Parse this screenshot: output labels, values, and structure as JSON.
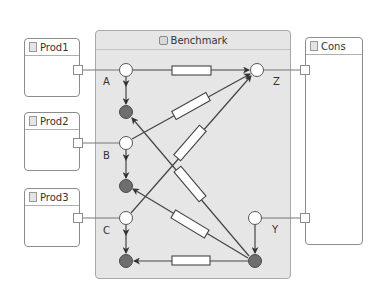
{
  "container": {
    "title": "Benchmark",
    "icon": "benchmark-icon"
  },
  "components": [
    {
      "id": "prod1",
      "title": "Prod1",
      "icon": "document-icon"
    },
    {
      "id": "prod2",
      "title": "Prod2",
      "icon": "document-icon"
    },
    {
      "id": "prod3",
      "title": "Prod3",
      "icon": "document-icon"
    },
    {
      "id": "cons",
      "title": "Cons",
      "icon": "document-icon"
    }
  ],
  "nodes": {
    "inputs": [
      "A",
      "B",
      "C"
    ],
    "outputs": [
      "Z",
      "Y"
    ]
  },
  "colors": {
    "container_fill": "#e6e6e6",
    "open_node": "#ffffff",
    "filled_node": "#6e6e6e",
    "wire": "#444444",
    "resistor_fill": "#ffffff"
  }
}
